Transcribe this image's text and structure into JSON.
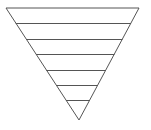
{
  "diagram": {
    "type": "inverted-triangle-layers",
    "background": "#ffffff",
    "stroke_color": "#555555",
    "stroke_width": 1,
    "triangle": {
      "top_left": [
        6,
        8
      ],
      "top_right": [
        139,
        8
      ],
      "apex": [
        79,
        120
      ]
    },
    "layer_lines_y": [
      23,
      39,
      54,
      70,
      85,
      100
    ],
    "layer_count": 7
  }
}
